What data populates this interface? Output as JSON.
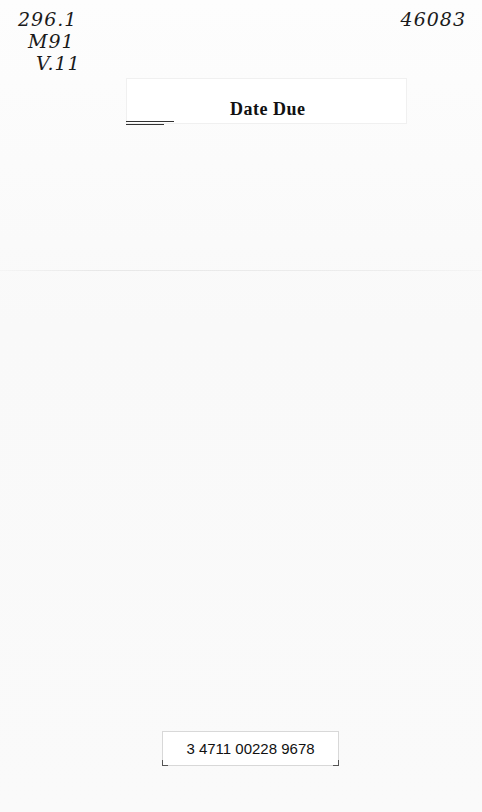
{
  "handwritten": {
    "call_number": [
      "296.1",
      "M91",
      "V.11"
    ],
    "accession_number": "46083"
  },
  "date_due": {
    "title": "Date Due"
  },
  "barcode": {
    "number": "3 4711 00228 9678"
  }
}
